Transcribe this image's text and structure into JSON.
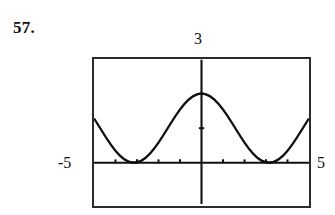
{
  "exercise": {
    "number_label": "57."
  },
  "graph": {
    "window": {
      "xmin_label": "-5",
      "xmax_label": "5",
      "ymax_label": "3"
    }
  },
  "chart_data": {
    "type": "line",
    "title": "",
    "subtitle": "",
    "xlabel": "",
    "ylabel": "",
    "xlim": [
      -5,
      5
    ],
    "ylim": [
      -1.25,
      3
    ],
    "grid": false,
    "legend": null,
    "axis_style": "graphing-calculator",
    "tick_spacing_x": 1,
    "tick_spacing_y": 1,
    "x_axis_tick_values": [
      -5,
      -4,
      -3,
      -2,
      -1,
      1,
      2,
      3,
      4,
      5
    ],
    "y_axis_tick_values": [
      1,
      2
    ],
    "annotations": [
      {
        "text": "3",
        "position": "top-center",
        "meaning": "y-window maximum"
      },
      {
        "text": "-5",
        "position": "left-of-xaxis",
        "meaning": "x-window minimum"
      },
      {
        "text": "5",
        "position": "right-of-xaxis",
        "meaning": "x-window maximum"
      }
    ],
    "series": [
      {
        "name": "y = 1 + cos(x)",
        "style": "dotted-pixels",
        "color": "#111111",
        "x": [
          -5.0,
          -4.8,
          -4.6,
          -4.4,
          -4.2,
          -4.0,
          -3.8,
          -3.6,
          -3.4,
          -3.2,
          -3.0,
          -2.8,
          -2.6,
          -2.4,
          -2.2,
          -2.0,
          -1.8,
          -1.6,
          -1.4,
          -1.2,
          -1.0,
          -0.8,
          -0.6,
          -0.4,
          -0.2,
          0.0,
          0.2,
          0.4,
          0.6,
          0.8,
          1.0,
          1.2,
          1.4,
          1.6,
          1.8,
          2.0,
          2.2,
          2.4,
          2.6,
          2.8,
          3.0,
          3.2,
          3.4,
          3.6,
          3.8,
          4.0,
          4.2,
          4.4,
          4.6,
          4.8,
          5.0
        ],
        "y": [
          1.284,
          1.087,
          0.888,
          0.693,
          0.51,
          0.346,
          0.209,
          0.104,
          0.034,
          0.002,
          0.01,
          0.058,
          0.143,
          0.263,
          0.411,
          0.584,
          0.773,
          0.971,
          1.17,
          1.362,
          1.54,
          1.697,
          1.825,
          1.921,
          1.98,
          2.0,
          1.98,
          1.921,
          1.825,
          1.697,
          1.54,
          1.362,
          1.17,
          0.971,
          0.773,
          0.584,
          0.411,
          0.263,
          0.143,
          0.058,
          0.01,
          0.002,
          0.034,
          0.104,
          0.209,
          0.346,
          0.51,
          0.693,
          0.888,
          1.087,
          1.284
        ]
      }
    ]
  }
}
